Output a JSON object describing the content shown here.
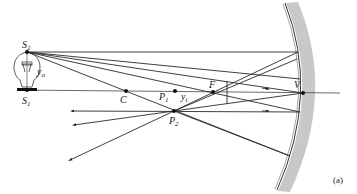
{
  "figure": {
    "caption": "(a)"
  },
  "colors": {
    "mirror_fill": "#c8c8c8",
    "mirror_edge": "#333333",
    "ray": "#2a2a2a",
    "background": "#ffffff"
  },
  "labels": {
    "S2": {
      "main": "S",
      "sub": "2",
      "x": 22,
      "y": 48
    },
    "S1": {
      "main": "S",
      "sub": "1",
      "x": 22,
      "y": 104
    },
    "yo": {
      "main": "y",
      "sub": "o",
      "x": 37,
      "y": 75
    },
    "C": {
      "main": "C",
      "sub": "",
      "x": 120,
      "y": 103
    },
    "P1": {
      "main": "P",
      "sub": "1",
      "x": 159,
      "y": 100
    },
    "yi": {
      "main": "y",
      "sub": "i",
      "x": 181,
      "y": 100
    },
    "P2": {
      "main": "P",
      "sub": "2",
      "x": 169,
      "y": 124
    },
    "F": {
      "main": "F",
      "sub": "",
      "x": 209,
      "y": 88
    },
    "V": {
      "main": "V",
      "sub": "",
      "x": 294,
      "y": 88
    }
  },
  "points": {
    "S2": [
      27,
      52
    ],
    "S1": [
      27,
      90
    ],
    "C": [
      126,
      91
    ],
    "P1": [
      175,
      91
    ],
    "P2": [
      174,
      111
    ],
    "F": [
      213,
      92
    ],
    "V": [
      303,
      93
    ]
  },
  "caption_pos": [
    333,
    183
  ]
}
